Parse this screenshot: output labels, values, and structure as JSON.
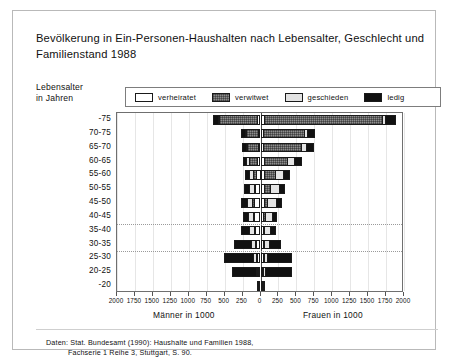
{
  "title": "Bevölkerung in Ein-Personen-Haushalten nach Lebensalter, Geschlecht und Familienstand 1988",
  "axis_group_label": "Lebensalter\nin Jahren",
  "axis_group_label_line1": "Lebensalter",
  "axis_group_label_line2": "in Jahren",
  "legend": [
    {
      "key": "married",
      "label": "verheiratet",
      "color": "#ffffff"
    },
    {
      "key": "widowed",
      "label": "verwitwet",
      "color": "#8d8d8d"
    },
    {
      "key": "divorced",
      "label": "geschieden",
      "color": "#e4e4e4"
    },
    {
      "key": "single",
      "label": "ledig",
      "color": "#111111"
    }
  ],
  "axis_caption_left": "Männer in 1000",
  "axis_caption_right": "Frauen in 1000",
  "source_line1": "Daten: Stat. Bundesamt (1990): Haushalte und Familien 1988,",
  "source_line2": "Fachserie 1 Reihe 3, Stuttgart, S. 90.",
  "chart_data": {
    "type": "bar",
    "subtype": "population-pyramid",
    "title": "Bevölkerung in Ein-Personen-Haushalten nach Lebensalter, Geschlecht und Familienstand 1988",
    "xlabel_left": "Männer in 1000",
    "xlabel_right": "Frauen in 1000",
    "ylabel": "Lebensalter in Jahren",
    "unit": "1000 Personen",
    "grid": true,
    "legend_position": "top",
    "xlim": [
      -2000,
      2000
    ],
    "xticks": [
      2000,
      1750,
      1500,
      1250,
      1000,
      750,
      500,
      250,
      0,
      250,
      500,
      750,
      1000,
      1250,
      1500,
      1750,
      2000
    ],
    "xtick_values": [
      -2000,
      -1750,
      -1500,
      -1250,
      -1000,
      -750,
      -500,
      -250,
      0,
      250,
      500,
      750,
      1000,
      1250,
      1500,
      1750,
      2000
    ],
    "categories": [
      "-75",
      "70-75",
      "65-70",
      "60-65",
      "55-60",
      "50-55",
      "45-50",
      "40-45",
      "35-40",
      "30-35",
      "25-30",
      "20-25",
      "-20"
    ],
    "series_order": [
      "married",
      "widowed",
      "divorced",
      "single"
    ],
    "series_labels": {
      "married": "verheiratet",
      "widowed": "verwitwet",
      "divorced": "geschieden",
      "single": "ledig"
    },
    "rows": [
      {
        "age": "-75",
        "men": {
          "married": 30,
          "widowed": 560,
          "divorced": 18,
          "single": 60
        },
        "women": {
          "married": 40,
          "widowed": 1660,
          "divorced": 45,
          "single": 150
        }
      },
      {
        "age": "70-75",
        "men": {
          "married": 20,
          "widowed": 190,
          "divorced": 20,
          "single": 40
        },
        "women": {
          "married": 25,
          "widowed": 585,
          "divorced": 45,
          "single": 100
        }
      },
      {
        "age": "65-70",
        "men": {
          "married": 18,
          "widowed": 175,
          "divorced": 25,
          "single": 35
        },
        "women": {
          "married": 25,
          "widowed": 540,
          "divorced": 75,
          "single": 105
        }
      },
      {
        "age": "60-65",
        "men": {
          "married": 45,
          "widowed": 120,
          "divorced": 45,
          "single": 40
        },
        "women": {
          "married": 30,
          "widowed": 340,
          "divorced": 110,
          "single": 95
        }
      },
      {
        "age": "55-60",
        "men": {
          "married": 60,
          "widowed": 45,
          "divorced": 60,
          "single": 55
        },
        "women": {
          "married": 35,
          "widowed": 160,
          "divorced": 130,
          "single": 80
        }
      },
      {
        "age": "50-55",
        "men": {
          "married": 70,
          "widowed": 25,
          "divorced": 70,
          "single": 60
        },
        "women": {
          "married": 35,
          "widowed": 90,
          "divorced": 135,
          "single": 75
        }
      },
      {
        "age": "45-50",
        "men": {
          "married": 90,
          "widowed": 20,
          "divorced": 85,
          "single": 75
        },
        "women": {
          "married": 35,
          "widowed": 55,
          "divorced": 140,
          "single": 65
        }
      },
      {
        "age": "40-45",
        "men": {
          "married": 80,
          "widowed": 12,
          "divorced": 80,
          "single": 75
        },
        "women": {
          "married": 30,
          "widowed": 30,
          "divorced": 110,
          "single": 55
        }
      },
      {
        "age": "35-40",
        "men": {
          "married": 75,
          "widowed": 8,
          "divorced": 75,
          "single": 115
        },
        "women": {
          "married": 25,
          "widowed": 18,
          "divorced": 100,
          "single": 75
        }
      },
      {
        "age": "30-35",
        "men": {
          "married": 60,
          "widowed": 5,
          "divorced": 60,
          "single": 240
        },
        "women": {
          "married": 25,
          "widowed": 10,
          "divorced": 85,
          "single": 160
        }
      },
      {
        "age": "25-30",
        "men": {
          "married": 40,
          "widowed": 3,
          "divorced": 45,
          "single": 420
        },
        "women": {
          "married": 20,
          "widowed": 5,
          "divorced": 55,
          "single": 360
        }
      },
      {
        "age": "20-25",
        "men": {
          "married": 15,
          "widowed": 2,
          "divorced": 15,
          "single": 370
        },
        "women": {
          "married": 12,
          "widowed": 2,
          "divorced": 20,
          "single": 400
        }
      },
      {
        "age": "-20",
        "men": {
          "married": 2,
          "widowed": 0,
          "divorced": 2,
          "single": 48
        },
        "women": {
          "married": 2,
          "widowed": 0,
          "divorced": 2,
          "single": 52
        }
      }
    ],
    "dashed_gridlines_after": [
      "40-45",
      "30-35"
    ]
  }
}
